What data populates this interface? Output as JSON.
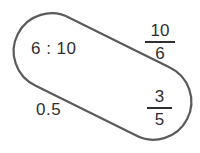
{
  "figure": {
    "name": "equivalent-value-capsule",
    "shape": "capsule",
    "stroke_color": "#5a5a5a",
    "fill_color": "#ffffff",
    "background_color": "#ffffff",
    "text_color": "#2f2f2f"
  },
  "labels": {
    "ratio": "6 : 10",
    "decimal": "0.5",
    "fraction_top": {
      "numerator": "10",
      "denominator": "6"
    },
    "fraction_bottom": {
      "numerator": "3",
      "denominator": "5"
    }
  }
}
